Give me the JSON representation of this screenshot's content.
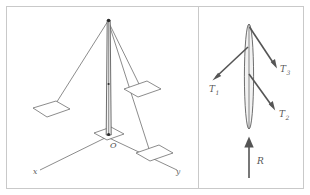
{
  "figure": {
    "background_color": "#ffffff",
    "frame_color": "#c9c9c9",
    "line_color": "#5a5a5a",
    "arrow_color": "#555555",
    "mast_fill": "#f2f2f2"
  },
  "left_panel": {
    "name": "three-dimensional-mast-diagram",
    "axes": {
      "x_label": "x",
      "y_label": "y",
      "origin_label": "O"
    },
    "mast": {
      "label": "vertical-mast",
      "top_node_label": "",
      "base_node_label": "O"
    },
    "anchor_plates": [
      {
        "id": "anchor-plate-x",
        "label": ""
      },
      {
        "id": "anchor-plate-mid",
        "label": ""
      },
      {
        "id": "anchor-plate-y",
        "label": ""
      },
      {
        "id": "anchor-plate-base",
        "label": ""
      }
    ],
    "guy_wires": [
      {
        "id": "guy-wire-1",
        "label": ""
      },
      {
        "id": "guy-wire-2",
        "label": ""
      },
      {
        "id": "guy-wire-3",
        "label": ""
      }
    ]
  },
  "right_panel": {
    "name": "free-body-diagram",
    "forces": [
      {
        "id": "force-t1",
        "symbol": "T",
        "subscript": "1",
        "direction": "down-left",
        "description": "tension in guy wire 1"
      },
      {
        "id": "force-t3",
        "symbol": "T",
        "subscript": "3",
        "direction": "down-right-upper",
        "description": "tension in guy wire 3"
      },
      {
        "id": "force-t2",
        "symbol": "T",
        "subscript": "2",
        "direction": "down-right-lower",
        "description": "tension in guy wire 2"
      },
      {
        "id": "force-r",
        "symbol": "R",
        "subscript": "",
        "direction": "up",
        "description": "reaction force at base of mast"
      }
    ]
  }
}
